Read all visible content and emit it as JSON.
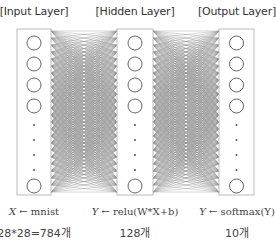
{
  "layers": [
    {
      "title": "[Input Layer]",
      "formula_lhs": "X",
      "formula_arrow": "←",
      "formula_rhs": "mnist",
      "count": "28*28=784개"
    },
    {
      "title": "[Hidden Layer]",
      "formula_lhs": "Y",
      "formula_arrow": "←",
      "formula_rhs": "relu(W*X+b)",
      "count": "128개"
    },
    {
      "title": "[Output Layer]",
      "formula_lhs": "Y",
      "formula_arrow": "←",
      "formula_rhs": "softmax(Y)",
      "count": "10개"
    }
  ],
  "colors": {
    "box_border": "#bbbbbb",
    "node_stroke": "#666666",
    "edge": "#888888",
    "text": "#333333"
  }
}
